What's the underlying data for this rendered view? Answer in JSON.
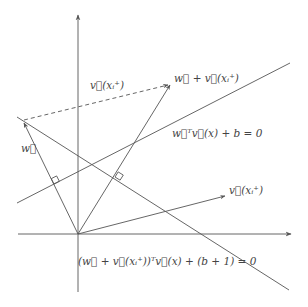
{
  "diagram": {
    "title": "",
    "colors": {
      "stroke": "#555555",
      "text": "#444444",
      "background": "#ffffff"
    },
    "axes": {
      "origin": [
        78,
        234
      ],
      "x_axis": {
        "from": [
          18,
          234
        ],
        "to": [
          291,
          234
        ],
        "arrow": true
      },
      "y_axis": {
        "from": [
          78,
          292
        ],
        "to": [
          78,
          15
        ],
        "arrow": true
      }
    },
    "vectors": [
      {
        "id": "w",
        "from": [
          78,
          234
        ],
        "to": [
          24,
          122
        ],
        "label": "w⃗"
      },
      {
        "id": "w_plus_v",
        "from": [
          78,
          234
        ],
        "to": [
          170,
          84
        ],
        "label": "w⃗ + v⃗(xᵢ⁺)"
      },
      {
        "id": "v_xi",
        "from": [
          78,
          234
        ],
        "to": [
          225,
          196
        ],
        "label": "v⃗(xᵢ⁺)"
      },
      {
        "id": "v_xi_dashed",
        "from": [
          24,
          120
        ],
        "to": [
          168,
          85
        ],
        "label": "v⃗(xᵢ⁺)",
        "dashed": true
      }
    ],
    "lines": [
      {
        "id": "hyperplane_1",
        "from": [
          17,
          203
        ],
        "to": [
          290,
          63
        ],
        "label": "w⃗ᵀv⃗(x) + b = 0"
      },
      {
        "id": "hyperplane_2",
        "from": [
          17,
          117
        ],
        "to": [
          289,
          290
        ],
        "label": "(w⃗ + v⃗(xᵢ⁺))ᵀv⃗(x) + (b+1) = 0"
      }
    ],
    "right_angle_markers": [
      {
        "at": [
          54,
          184
        ],
        "between": [
          "w",
          "hyperplane_1"
        ]
      },
      {
        "at": [
          115,
          177
        ],
        "between": [
          "w_plus_v",
          "hyperplane_2"
        ]
      }
    ],
    "labels": {
      "w": "w⃗",
      "v_dashed": "v⃗(xᵢ⁺)",
      "w_plus_v": "w⃗ + v⃗(xᵢ⁺)",
      "hyperplane_1": "w⃗ᵀv⃗(x) + b = 0",
      "v_xi": "v⃗(xᵢ⁺)",
      "hyperplane_2": "(w⃗ + v⃗(xᵢ⁺))ᵀv⃗(x) + (b + 1) = 0"
    }
  }
}
